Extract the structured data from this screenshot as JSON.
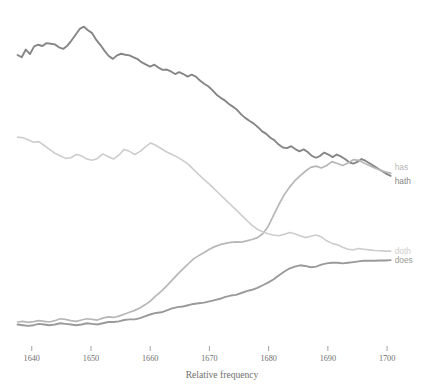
{
  "chart_data": {
    "type": "line",
    "title": "",
    "subtitle": "",
    "xlabel": "Relative frequency",
    "ylabel": "",
    "grid": false,
    "legend_position": "right-inline-end-of-line",
    "xlim": [
      1637,
      1701
    ],
    "ylim": [
      0,
      1.0
    ],
    "xticks": [
      1640,
      1650,
      1660,
      1670,
      1680,
      1690,
      1700
    ],
    "xtick_labels": [
      "1640",
      "1650",
      "1660",
      "1670",
      "1680",
      "1690",
      "1700"
    ],
    "yticks": [],
    "ytick_labels": [],
    "annotations": [],
    "series": [
      {
        "name": "hath",
        "label": "hath",
        "color": "#868686",
        "stroke_width": 1.9,
        "x": [
          1637.6,
          1638.3,
          1639.0,
          1639.7,
          1640.4,
          1641.1,
          1641.8,
          1642.5,
          1643.2,
          1643.9,
          1644.6,
          1645.3,
          1646.0,
          1646.7,
          1647.4,
          1648.1,
          1648.8,
          1649.5,
          1650.2,
          1650.9,
          1651.6,
          1652.3,
          1653.0,
          1653.7,
          1654.4,
          1655.1,
          1655.8,
          1656.5,
          1657.2,
          1657.9,
          1658.6,
          1659.3,
          1660.0,
          1660.7,
          1661.4,
          1662.1,
          1662.8,
          1663.5,
          1664.2,
          1664.9,
          1665.6,
          1666.3,
          1667.0,
          1667.7,
          1668.4,
          1669.1,
          1669.8,
          1670.5,
          1671.2,
          1671.9,
          1672.6,
          1673.3,
          1674.0,
          1674.7,
          1675.4,
          1676.1,
          1676.8,
          1677.5,
          1678.2,
          1678.9,
          1679.6,
          1680.3,
          1681.0,
          1681.7,
          1682.4,
          1683.1,
          1683.8,
          1684.5,
          1685.2,
          1685.9,
          1686.6,
          1687.3,
          1688.0,
          1688.7,
          1689.4,
          1690.1,
          1690.8,
          1691.5,
          1692.2,
          1692.9,
          1693.6,
          1694.3,
          1695.0,
          1695.7,
          1696.4,
          1697.1,
          1697.8,
          1698.5,
          1699.2,
          1699.9,
          1700.6
        ],
        "y": [
          0.885,
          0.878,
          0.902,
          0.888,
          0.912,
          0.917,
          0.913,
          0.922,
          0.92,
          0.918,
          0.909,
          0.904,
          0.914,
          0.93,
          0.948,
          0.966,
          0.973,
          0.962,
          0.953,
          0.932,
          0.916,
          0.898,
          0.882,
          0.873,
          0.884,
          0.889,
          0.886,
          0.884,
          0.878,
          0.872,
          0.862,
          0.855,
          0.849,
          0.855,
          0.846,
          0.839,
          0.84,
          0.834,
          0.826,
          0.832,
          0.826,
          0.818,
          0.824,
          0.818,
          0.806,
          0.796,
          0.788,
          0.776,
          0.762,
          0.752,
          0.744,
          0.733,
          0.724,
          0.714,
          0.7,
          0.689,
          0.68,
          0.672,
          0.661,
          0.648,
          0.64,
          0.628,
          0.62,
          0.607,
          0.598,
          0.596,
          0.602,
          0.593,
          0.586,
          0.592,
          0.584,
          0.572,
          0.566,
          0.572,
          0.582,
          0.576,
          0.568,
          0.576,
          0.57,
          0.562,
          0.552,
          0.548,
          0.553,
          0.562,
          0.556,
          0.548,
          0.54,
          0.532,
          0.524,
          0.516,
          0.51
        ]
      },
      {
        "name": "has",
        "label": "has",
        "color": "#b7b7b7",
        "stroke_width": 1.7,
        "x": [
          1637.6,
          1638.5,
          1639.4,
          1640.3,
          1641.2,
          1642.1,
          1643.0,
          1643.9,
          1644.8,
          1645.7,
          1646.6,
          1647.5,
          1648.4,
          1649.3,
          1650.2,
          1651.1,
          1652.0,
          1652.9,
          1653.8,
          1654.7,
          1655.6,
          1656.5,
          1657.4,
          1658.3,
          1659.2,
          1660.1,
          1661.0,
          1661.9,
          1662.8,
          1663.7,
          1664.6,
          1665.5,
          1666.4,
          1667.3,
          1668.2,
          1669.1,
          1670.0,
          1670.9,
          1671.8,
          1672.7,
          1673.6,
          1674.5,
          1675.4,
          1676.3,
          1677.2,
          1678.1,
          1679.0,
          1679.9,
          1680.8,
          1681.7,
          1682.6,
          1683.5,
          1684.4,
          1685.3,
          1686.2,
          1687.1,
          1688.0,
          1688.9,
          1689.8,
          1690.7,
          1691.6,
          1692.5,
          1693.4,
          1694.3,
          1695.2,
          1696.1,
          1697.0,
          1697.9,
          1698.8,
          1699.7,
          1700.6
        ],
        "y": [
          0.056,
          0.058,
          0.055,
          0.057,
          0.06,
          0.058,
          0.056,
          0.06,
          0.066,
          0.064,
          0.06,
          0.058,
          0.062,
          0.066,
          0.064,
          0.062,
          0.068,
          0.072,
          0.07,
          0.074,
          0.08,
          0.086,
          0.092,
          0.1,
          0.11,
          0.122,
          0.138,
          0.152,
          0.168,
          0.186,
          0.204,
          0.22,
          0.236,
          0.252,
          0.262,
          0.272,
          0.282,
          0.29,
          0.296,
          0.3,
          0.303,
          0.305,
          0.304,
          0.308,
          0.312,
          0.318,
          0.33,
          0.352,
          0.386,
          0.42,
          0.45,
          0.474,
          0.494,
          0.51,
          0.524,
          0.536,
          0.54,
          0.534,
          0.542,
          0.554,
          0.548,
          0.542,
          0.55,
          0.56,
          0.558,
          0.55,
          0.542,
          0.534,
          0.528,
          0.522,
          0.518
        ]
      },
      {
        "name": "doth",
        "label": "doth",
        "color": "#cdcdcd",
        "stroke_width": 1.6,
        "x": [
          1637.6,
          1638.5,
          1639.4,
          1640.3,
          1641.2,
          1642.1,
          1643.0,
          1643.9,
          1644.8,
          1645.7,
          1646.6,
          1647.5,
          1648.4,
          1649.3,
          1650.2,
          1651.1,
          1652.0,
          1652.9,
          1653.8,
          1654.7,
          1655.6,
          1656.5,
          1657.4,
          1658.3,
          1659.2,
          1660.1,
          1661.0,
          1661.9,
          1662.8,
          1663.7,
          1664.6,
          1665.5,
          1666.4,
          1667.3,
          1668.2,
          1669.1,
          1670.0,
          1670.9,
          1671.8,
          1672.7,
          1673.6,
          1674.5,
          1675.4,
          1676.3,
          1677.2,
          1678.1,
          1679.0,
          1679.9,
          1680.8,
          1681.7,
          1682.6,
          1683.5,
          1684.4,
          1685.3,
          1686.2,
          1687.1,
          1688.0,
          1688.9,
          1689.8,
          1690.7,
          1691.6,
          1692.5,
          1693.4,
          1694.3,
          1695.2,
          1696.1,
          1697.0,
          1697.9,
          1698.8,
          1699.7,
          1700.6
        ],
        "y": [
          0.63,
          0.628,
          0.622,
          0.614,
          0.616,
          0.604,
          0.592,
          0.58,
          0.572,
          0.564,
          0.566,
          0.576,
          0.572,
          0.562,
          0.558,
          0.564,
          0.578,
          0.57,
          0.562,
          0.574,
          0.592,
          0.586,
          0.576,
          0.586,
          0.6,
          0.612,
          0.604,
          0.594,
          0.584,
          0.576,
          0.568,
          0.558,
          0.546,
          0.53,
          0.514,
          0.498,
          0.484,
          0.468,
          0.452,
          0.436,
          0.42,
          0.404,
          0.388,
          0.372,
          0.356,
          0.344,
          0.336,
          0.33,
          0.326,
          0.324,
          0.328,
          0.334,
          0.33,
          0.324,
          0.318,
          0.322,
          0.326,
          0.32,
          0.308,
          0.3,
          0.296,
          0.288,
          0.282,
          0.28,
          0.284,
          0.282,
          0.28,
          0.278,
          0.277,
          0.276,
          0.276
        ]
      },
      {
        "name": "does",
        "label": "does",
        "color": "#9a9a9a",
        "stroke_width": 1.9,
        "x": [
          1637.6,
          1638.5,
          1639.4,
          1640.3,
          1641.2,
          1642.1,
          1643.0,
          1643.9,
          1644.8,
          1645.7,
          1646.6,
          1647.5,
          1648.4,
          1649.3,
          1650.2,
          1651.1,
          1652.0,
          1652.9,
          1653.8,
          1654.7,
          1655.6,
          1656.5,
          1657.4,
          1658.3,
          1659.2,
          1660.1,
          1661.0,
          1661.9,
          1662.8,
          1663.7,
          1664.6,
          1665.5,
          1666.4,
          1667.3,
          1668.2,
          1669.1,
          1670.0,
          1670.9,
          1671.8,
          1672.7,
          1673.6,
          1674.5,
          1675.4,
          1676.3,
          1677.2,
          1678.1,
          1679.0,
          1679.9,
          1680.8,
          1681.7,
          1682.6,
          1683.5,
          1684.4,
          1685.3,
          1686.2,
          1687.1,
          1688.0,
          1688.9,
          1689.8,
          1690.7,
          1691.6,
          1692.5,
          1693.4,
          1694.3,
          1695.2,
          1696.1,
          1697.0,
          1697.9,
          1698.8,
          1699.7,
          1700.6
        ],
        "y": [
          0.048,
          0.046,
          0.044,
          0.046,
          0.05,
          0.048,
          0.046,
          0.048,
          0.052,
          0.05,
          0.048,
          0.046,
          0.048,
          0.052,
          0.05,
          0.048,
          0.052,
          0.056,
          0.056,
          0.058,
          0.062,
          0.064,
          0.064,
          0.068,
          0.074,
          0.08,
          0.084,
          0.086,
          0.092,
          0.098,
          0.102,
          0.104,
          0.108,
          0.112,
          0.114,
          0.116,
          0.12,
          0.124,
          0.128,
          0.134,
          0.138,
          0.14,
          0.146,
          0.152,
          0.156,
          0.162,
          0.17,
          0.178,
          0.188,
          0.2,
          0.212,
          0.222,
          0.228,
          0.232,
          0.23,
          0.226,
          0.228,
          0.234,
          0.238,
          0.24,
          0.24,
          0.238,
          0.24,
          0.242,
          0.244,
          0.246,
          0.246,
          0.246,
          0.247,
          0.247,
          0.248
        ]
      }
    ]
  },
  "labels": {
    "has": "has",
    "hath": "hath",
    "doth": "doth",
    "does": "does"
  }
}
